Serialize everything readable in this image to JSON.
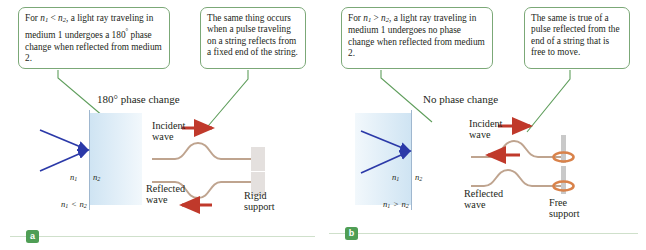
{
  "figure": {
    "panels": [
      {
        "id": "a",
        "badge": "a",
        "heading": "180° phase change",
        "callouts": [
          {
            "name": "optics-callout",
            "lines": [
              "For n1 < n2, a light ray traveling",
              "in medium 1 undergoes a 180°",
              "phase change when reflected",
              "from medium 2."
            ]
          },
          {
            "name": "string-callout",
            "lines": [
              "The same thing occurs",
              "when a pulse traveling",
              "on a string reflects from",
              "a fixed end of the string."
            ]
          }
        ],
        "optics": {
          "medium_left_label": "n1",
          "medium_right_label": "n2",
          "comparison_left": "n1",
          "comparison_op": "<",
          "comparison_right": "n2",
          "shaded_side": "right"
        },
        "strings": {
          "incident_label_line1": "Incident",
          "incident_label_line2": "wave",
          "reflected_label_line1": "Reflected",
          "reflected_label_line2": "wave",
          "support_label_line1": "Rigid",
          "support_label_line2": "support",
          "incident_pulse": "up",
          "reflected_pulse": "down",
          "support_type": "rigid"
        }
      },
      {
        "id": "b",
        "badge": "b",
        "heading": "No phase change",
        "callouts": [
          {
            "name": "optics-callout",
            "lines": [
              "For n1 > n2, a light ray traveling",
              "in medium 1 undergoes no",
              "phase change when reflected",
              "from medium 2."
            ]
          },
          {
            "name": "string-callout",
            "lines": [
              "The same is true of a",
              "pulse reflected from",
              "the end of a string",
              "that is free to move."
            ]
          }
        ],
        "optics": {
          "medium_left_label": "n1",
          "medium_right_label": "n2",
          "comparison_left": "n1",
          "comparison_op": ">",
          "comparison_right": "n2",
          "shaded_side": "left"
        },
        "strings": {
          "incident_label_line1": "Incident",
          "incident_label_line2": "wave",
          "reflected_label_line1": "Reflected",
          "reflected_label_line2": "wave",
          "support_label_line1": "Free",
          "support_label_line2": "support",
          "incident_pulse": "up",
          "reflected_pulse": "up",
          "support_type": "free"
        }
      }
    ],
    "colors": {
      "callout_border": "#7ba877",
      "leader_line": "#5f9e5c",
      "light_ray": "#2b39a8",
      "medium_shade": "#cfe4f3",
      "interface": "#9fb7cf",
      "string": "#bfa48f",
      "wave_arrow": "#c0392b",
      "support_block": "#e4e0de",
      "free_ring": "#d9824a",
      "badge_bg": "#4f9e55",
      "rule": "#cfe0cb"
    }
  }
}
